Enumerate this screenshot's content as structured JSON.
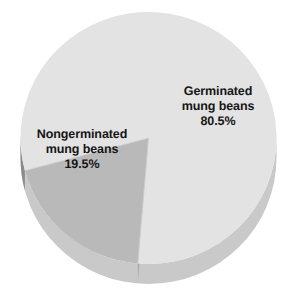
{
  "chart_data": {
    "type": "pie",
    "title": "",
    "categories": [
      "Germinated mung beans",
      "Nongerminated mung beans"
    ],
    "values": [
      80.5,
      19.5
    ],
    "value_unit": "%",
    "slices": [
      {
        "label_line1": "Germinated",
        "label_line2": "mung beans",
        "value_text": "80.5%",
        "value": 80.5,
        "color": "#e3e3e3",
        "side_color": "#c9c9c9",
        "start_angle_deg": 255,
        "end_angle_deg": 164.8
      },
      {
        "label_line1": "Nongerminated",
        "label_line2": "mung beans",
        "value_text": "19.5%",
        "value": 19.5,
        "color": "#b9b9b9",
        "side_color": "#8b8b8b",
        "start_angle_deg": 164.8,
        "end_angle_deg": 255
      }
    ],
    "legend_position": "none",
    "grid": false,
    "three_d": true,
    "background_color": "#ffffff",
    "text_color": "#151515"
  },
  "labels": {
    "germinated": {
      "line1": "Germinated",
      "line2": "mung beans",
      "line3": "80.5%"
    },
    "nongerminated": {
      "line1": "Nongerminated",
      "line2": "mung beans",
      "line3": "19.5%"
    }
  }
}
